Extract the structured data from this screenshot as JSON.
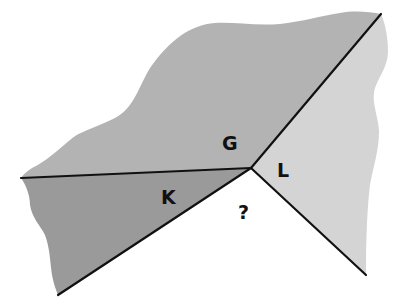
{
  "diagram": {
    "type": "angle-regions",
    "vertex": {
      "x": 251,
      "y": 168
    },
    "regions": [
      {
        "id": "G",
        "label": "G",
        "fill": "#b3b3b3"
      },
      {
        "id": "K",
        "label": "K",
        "fill": "#9a9a9a"
      },
      {
        "id": "L",
        "label": "L",
        "fill": "#d4d4d4"
      },
      {
        "id": "unknown",
        "label": "?",
        "fill": "#ffffff"
      }
    ],
    "colors": {
      "line": "#111111",
      "background": "#ffffff"
    }
  }
}
